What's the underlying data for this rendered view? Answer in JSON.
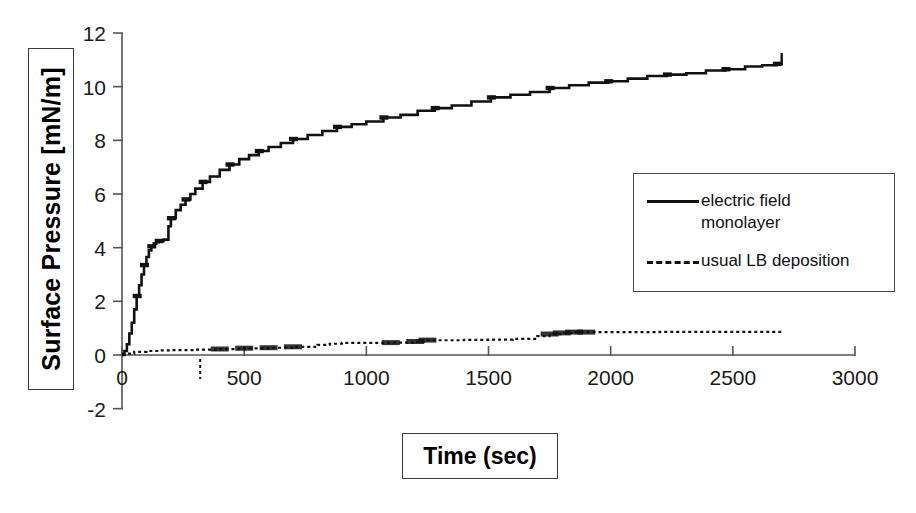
{
  "figure": {
    "background": "#ffffff",
    "ink_color": "#111111"
  },
  "axes": {
    "x": {
      "label": "Time (sec)",
      "ticks": [
        0,
        500,
        1000,
        1500,
        2000,
        2500,
        3000
      ],
      "tick_labels": [
        "0",
        "500",
        "1000",
        "1500",
        "2000",
        "2500",
        "3000"
      ],
      "min": 0,
      "max": 3000
    },
    "y": {
      "label": "Surface Pressure [mN/m]",
      "ticks": [
        -2,
        0,
        2,
        4,
        6,
        8,
        10,
        12
      ],
      "tick_labels": [
        "-2",
        "0",
        "2",
        "4",
        "6",
        "8",
        "10",
        "12"
      ],
      "min": -2,
      "max": 12
    }
  },
  "legend": {
    "position": "upper-right",
    "entries": [
      {
        "label": "electric field\nmonolayer",
        "style": "solid",
        "name": "electric-field-monolayer"
      },
      {
        "label": "usual LB deposition",
        "style": "dashed",
        "name": "usual-lb-deposition"
      }
    ]
  },
  "chart_data": {
    "type": "line",
    "title": "",
    "xlabel": "Time (sec)",
    "ylabel": "Surface Pressure [mN/m]",
    "xlim": [
      0,
      3000
    ],
    "ylim": [
      -2,
      12
    ],
    "grid": false,
    "legend_position": "upper-right",
    "series": [
      {
        "name": "electric field monolayer",
        "style": "solid",
        "color": "#111111",
        "x": [
          0,
          10,
          20,
          30,
          40,
          50,
          60,
          70,
          80,
          90,
          100,
          110,
          120,
          130,
          140,
          150,
          170,
          190,
          200,
          220,
          240,
          260,
          280,
          300,
          330,
          360,
          400,
          440,
          480,
          520,
          560,
          600,
          650,
          700,
          760,
          820,
          880,
          940,
          1000,
          1070,
          1140,
          1210,
          1280,
          1350,
          1430,
          1510,
          1590,
          1670,
          1750,
          1830,
          1910,
          1990,
          2070,
          2150,
          2230,
          2310,
          2390,
          2470,
          2550,
          2620,
          2680,
          2700
        ],
        "y": [
          0.0,
          0.15,
          0.4,
          0.8,
          1.2,
          1.7,
          2.2,
          2.6,
          3.0,
          3.35,
          3.65,
          3.9,
          4.05,
          4.15,
          4.2,
          4.25,
          4.3,
          4.8,
          5.1,
          5.4,
          5.6,
          5.8,
          6.0,
          6.2,
          6.45,
          6.65,
          6.9,
          7.1,
          7.3,
          7.45,
          7.6,
          7.75,
          7.9,
          8.05,
          8.2,
          8.35,
          8.5,
          8.6,
          8.7,
          8.85,
          8.95,
          9.1,
          9.2,
          9.3,
          9.45,
          9.6,
          9.7,
          9.8,
          9.95,
          10.05,
          10.15,
          10.2,
          10.3,
          10.4,
          10.45,
          10.5,
          10.6,
          10.65,
          10.75,
          10.8,
          10.85,
          10.9
        ]
      },
      {
        "name": "usual LB deposition",
        "style": "dashed",
        "color": "#111111",
        "x": [
          0,
          50,
          100,
          150,
          200,
          300,
          400,
          500,
          600,
          700,
          800,
          850,
          900,
          1000,
          1100,
          1200,
          1250,
          1300,
          1400,
          1500,
          1600,
          1700,
          1750,
          1800,
          1850,
          1900,
          2000,
          2100,
          2200,
          2300,
          2400,
          2500,
          2600,
          2700
        ],
        "y": [
          0.05,
          0.12,
          0.15,
          0.17,
          0.18,
          0.2,
          0.22,
          0.25,
          0.27,
          0.3,
          0.38,
          0.42,
          0.45,
          0.45,
          0.46,
          0.5,
          0.55,
          0.55,
          0.56,
          0.57,
          0.6,
          0.7,
          0.78,
          0.82,
          0.85,
          0.85,
          0.85,
          0.85,
          0.86,
          0.86,
          0.86,
          0.86,
          0.86,
          0.86
        ]
      }
    ]
  }
}
